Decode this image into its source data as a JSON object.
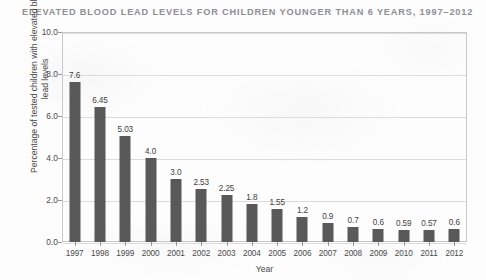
{
  "chart_data": {
    "type": "bar",
    "title": "ELEVATED BLOOD LEAD LEVELS FOR CHILDREN YOUNGER THAN 6 YEARS, 1997–2012",
    "xlabel": "Year",
    "ylabel": "Percentage of tested children with elevated blood lead levels",
    "categories": [
      "1997",
      "1998",
      "1999",
      "2000",
      "2001",
      "2002",
      "2003",
      "2004",
      "2005",
      "2006",
      "2007",
      "2008",
      "2009",
      "2010",
      "2011",
      "2012"
    ],
    "values": [
      7.6,
      6.45,
      5.03,
      4.0,
      3.0,
      2.53,
      2.25,
      1.8,
      1.55,
      1.2,
      0.9,
      0.7,
      0.6,
      0.59,
      0.57,
      0.6
    ],
    "value_labels": [
      "7.6",
      "6.45",
      "5.03",
      "4.0",
      "3.0",
      "2.53",
      "2.25",
      "1.8",
      "1.55",
      "1.2",
      "0.9",
      "0.7",
      "0.6",
      "0.59",
      "0.57",
      "0.6"
    ],
    "ylim": [
      0,
      10
    ],
    "yticks": [
      0,
      2,
      4,
      6,
      8,
      10
    ],
    "ytick_labels": [
      "0.0",
      "2.0",
      "4.0",
      "6.0",
      "8.0",
      "10.0"
    ],
    "grid": true,
    "legend": "none",
    "bar_color": "#595959",
    "grid_color": "#dcdcdc",
    "axis_color": "#c9c9c9",
    "title_color": "#8d8f93",
    "text_color": "#4a4a4a",
    "background_color": "#fdfdfd"
  }
}
